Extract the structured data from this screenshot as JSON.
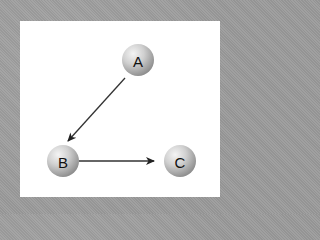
{
  "diagram": {
    "type": "directed-graph",
    "colors": {
      "background": "#9c9c9c",
      "panel": "#ffffff",
      "node_light": "#f2f2f2",
      "node_dark": "#8a8a8a",
      "edge": "#333333",
      "label": "#111111"
    },
    "nodes": [
      {
        "id": "A",
        "label": "A",
        "cx": 138,
        "cy": 60,
        "r": 16
      },
      {
        "id": "B",
        "label": "B",
        "cx": 63,
        "cy": 161,
        "r": 16
      },
      {
        "id": "C",
        "label": "C",
        "cx": 180,
        "cy": 161,
        "r": 16
      }
    ],
    "edges": [
      {
        "from": "A",
        "to": "B",
        "x1": 125,
        "y1": 78,
        "x2": 68,
        "y2": 141
      },
      {
        "from": "B",
        "to": "C",
        "x1": 79,
        "y1": 161,
        "x2": 154,
        "y2": 161
      }
    ]
  }
}
